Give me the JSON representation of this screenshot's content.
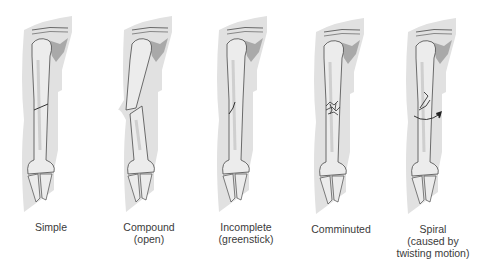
{
  "figure": {
    "type": "fracture-types-illustration",
    "colors": {
      "silhouette": "#e1e1e1",
      "bone": "#ececec",
      "bone_shade": "#cfcfcf",
      "scapula": "#a9a9a9",
      "outline": "#4a4a4a",
      "label_text": "#3a3a3a"
    },
    "panels": [
      {
        "id": "simple",
        "label_lines": [
          "Simple"
        ]
      },
      {
        "id": "compound",
        "label_lines": [
          "Compound",
          "(open)"
        ]
      },
      {
        "id": "incomplete",
        "label_lines": [
          "Incomplete",
          "(greenstick)"
        ]
      },
      {
        "id": "comminuted",
        "label_lines": [
          "Comminuted"
        ]
      },
      {
        "id": "spiral",
        "label_lines": [
          "Spiral",
          "(caused by",
          "twisting motion)"
        ]
      }
    ]
  }
}
